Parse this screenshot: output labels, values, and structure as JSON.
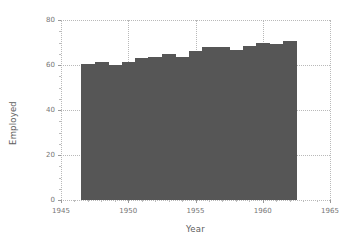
{
  "chart_data": {
    "type": "bar",
    "title": "",
    "xlabel": "Year",
    "ylabel": "Employed",
    "xlim": [
      1945,
      1965
    ],
    "ylim": [
      0,
      80
    ],
    "grid": true,
    "legend": null,
    "bar_color": "#565656",
    "grid_color": "#b9b9b9",
    "axis_text_color": "#767676",
    "background_color": "#ffffff",
    "bar_width_years": 1.0,
    "xticks": [
      1945,
      1950,
      1955,
      1960,
      1965
    ],
    "xticklabels": [
      "1945",
      "1950",
      "1955",
      "1960",
      "1965"
    ],
    "yticks": [
      0,
      20,
      40,
      60,
      80
    ],
    "yticklabels": [
      "0",
      "20",
      "40",
      "60",
      "80"
    ],
    "x": [
      1947,
      1948,
      1949,
      1950,
      1951,
      1952,
      1953,
      1954,
      1955,
      1956,
      1957,
      1958,
      1959,
      1960,
      1961,
      1962
    ],
    "categories": [
      "1947",
      "1948",
      "1949",
      "1950",
      "1951",
      "1952",
      "1953",
      "1954",
      "1955",
      "1956",
      "1957",
      "1958",
      "1959",
      "1960",
      "1961",
      "1962"
    ],
    "values": [
      60.323,
      61.122,
      60.171,
      61.187,
      63.221,
      63.639,
      64.989,
      63.761,
      66.019,
      67.857,
      68.169,
      66.513,
      68.655,
      69.564,
      69.331,
      70.551
    ]
  }
}
